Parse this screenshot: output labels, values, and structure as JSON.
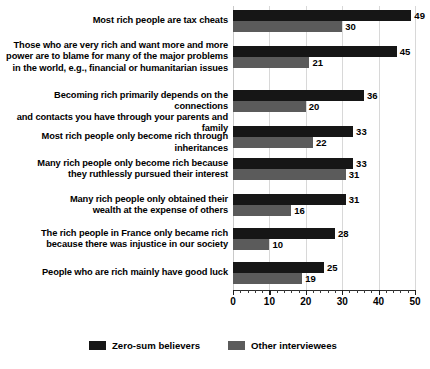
{
  "chart_data": {
    "type": "bar",
    "orientation": "horizontal",
    "title": "",
    "xlabel": "",
    "ylabel": "",
    "xlim": [
      0,
      50
    ],
    "xticks": [
      0,
      10,
      20,
      30,
      40,
      50
    ],
    "xtick_labels": [
      "0",
      "10",
      "20",
      "30",
      "40",
      "50"
    ],
    "minor_tick_step": 2,
    "grid": true,
    "grid_axis": "x",
    "legend_position": "bottom",
    "categories": [
      "Most rich people are tax cheats",
      "Those who are very rich and want more and more power are to blame for many of the major problems in the world, e.g., financial or humanitarian issues",
      "Becoming rich primarily depends on the connections and contacts you have through your parents and family",
      "Most rich people only become rich through inheritances",
      "Many rich people only become rich because they ruthlessly pursued their interest",
      "Many rich people only obtained their wealth at the expense of others",
      "The rich people in France only became rich because there was injustice in our society",
      "People who are rich mainly have good luck"
    ],
    "category_lines": [
      [
        "Most rich people are tax cheats"
      ],
      [
        "Those who are very rich and want more and more",
        "power are to blame for many of the major problems",
        "in the world, e.g., financial or humanitarian issues"
      ],
      [
        "Becoming rich primarily depends on the connections",
        "and contacts you have through your parents and family"
      ],
      [
        "Most rich people only become rich through inheritances"
      ],
      [
        "Many rich people only become rich because",
        "they ruthlessly pursued their interest"
      ],
      [
        "Many rich people only obtained their",
        "wealth at the expense of others"
      ],
      [
        "The rich people in France only became rich",
        "because there was injustice in our society"
      ],
      [
        "People who are rich mainly have good luck"
      ]
    ],
    "series": [
      {
        "name": "Zero-sum believers",
        "color": "#161616",
        "values": [
          49,
          45,
          36,
          33,
          33,
          31,
          28,
          25
        ]
      },
      {
        "name": "Other interviewees",
        "color": "#5b5b5b",
        "values": [
          30,
          21,
          20,
          22,
          31,
          16,
          10,
          19
        ]
      }
    ]
  },
  "legend": {
    "items": [
      {
        "label": "Zero-sum believers",
        "color": "#161616"
      },
      {
        "label": "Other interviewees",
        "color": "#5b5b5b"
      }
    ]
  },
  "colors": {
    "background": "#ffffff",
    "primary_series": "#161616",
    "secondary_series": "#5b5b5b",
    "gridline": "#d8d8d8",
    "axis": "#2b2b2b",
    "text": "#000000"
  }
}
